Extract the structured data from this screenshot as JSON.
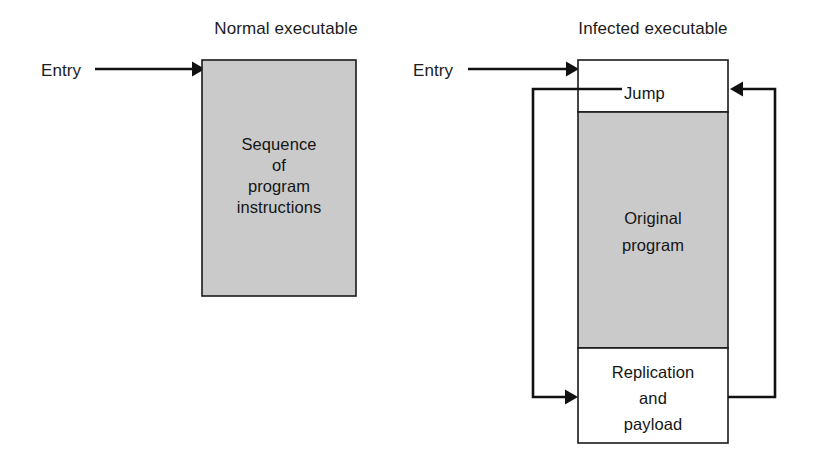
{
  "figure": {
    "type": "diagram",
    "background_color": "#ffffff",
    "shaded_fill": "#cacaca",
    "line_color": "#111111"
  },
  "left_diagram": {
    "title": "Normal executable",
    "entry_label": "Entry",
    "box_lines": [
      "Sequence",
      "of",
      "program",
      "instructions"
    ]
  },
  "right_diagram": {
    "title": "Infected executable",
    "entry_label": "Entry",
    "sections": [
      {
        "name": "jump",
        "label": "Jump",
        "shaded": false
      },
      {
        "name": "original-program",
        "label_lines": [
          "Original",
          "program"
        ],
        "shaded": true
      },
      {
        "name": "replication-and-payload",
        "label_lines": [
          "Replication",
          "and",
          "payload"
        ],
        "shaded": false
      }
    ],
    "jump_label": "Jump",
    "original_line1": "Original",
    "original_line2": "program",
    "replication_line1": "Replication",
    "replication_line2": "and",
    "replication_line3": "payload"
  }
}
